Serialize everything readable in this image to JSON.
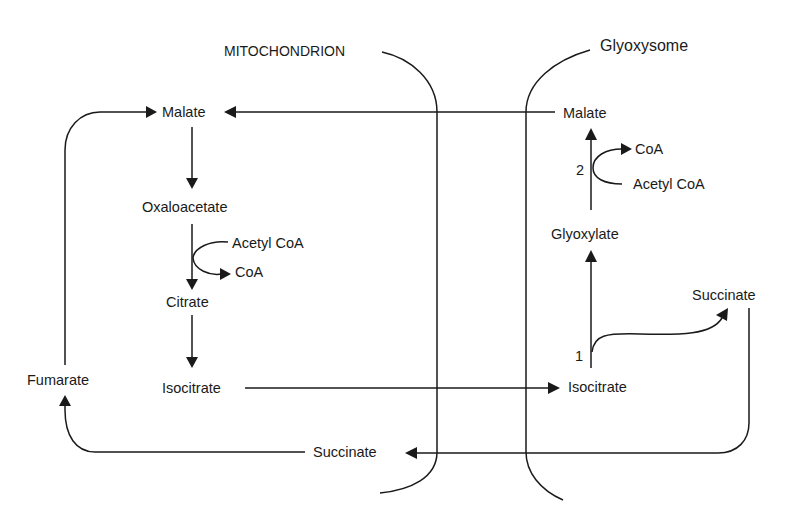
{
  "diagram": {
    "compartments": {
      "mitochondrion": {
        "label": "MITOCHONDRION"
      },
      "glyoxysome": {
        "label": "Glyoxysome"
      }
    },
    "mitochondrion_metabolites": {
      "malate": "Malate",
      "oxaloacetate": "Oxaloacetate",
      "acetyl_coa": "Acetyl CoA",
      "coa": "CoA",
      "citrate": "Citrate",
      "isocitrate": "Isocitrate",
      "fumarate": "Fumarate",
      "succinate": "Succinate"
    },
    "glyoxysome_metabolites": {
      "malate": "Malate",
      "coa": "CoA",
      "acetyl_coa": "Acetyl CoA",
      "glyoxylate": "Glyoxylate",
      "succinate": "Succinate",
      "isocitrate": "Isocitrate"
    },
    "enzyme_labels": {
      "enzyme_1": "1",
      "enzyme_2": "2"
    },
    "colors": {
      "ink": "#1a1a1a",
      "background": "#ffffff"
    }
  }
}
